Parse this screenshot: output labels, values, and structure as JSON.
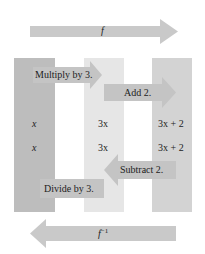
{
  "diagram": {
    "top_arrow": {
      "label": "f",
      "direction": "right"
    },
    "bottom_arrow": {
      "label": "f",
      "superscript": "−1",
      "direction": "left"
    },
    "columns": [
      {
        "name": "input",
        "row1": "x",
        "row2": "x",
        "color": "#bdbdbd"
      },
      {
        "name": "intermediate",
        "row1": "3x",
        "row2": "3x",
        "color": "#e6e6e6"
      },
      {
        "name": "output",
        "row1": "3x + 2",
        "row2": "3x + 2",
        "color": "#d3d3d3"
      }
    ],
    "steps_forward": [
      {
        "label": "Multiply by 3.",
        "direction": "right"
      },
      {
        "label": "Add 2.",
        "direction": "right"
      }
    ],
    "steps_inverse": [
      {
        "label": "Subtract 2.",
        "direction": "left"
      },
      {
        "label": "Divide by 3.",
        "direction": "left"
      }
    ],
    "colors": {
      "arrow": "#c9c9c9",
      "step_arrow": "#c4c4c4",
      "background": "#ffffff",
      "text": "#222222"
    }
  }
}
